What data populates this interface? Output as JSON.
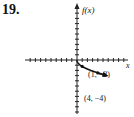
{
  "problem_number": "19.",
  "chart_data": {
    "type": "line",
    "title": "",
    "xlabel": "x",
    "ylabel": "f(x)",
    "function": "f(x) = -2√x",
    "x": [
      0,
      0.25,
      1,
      2.25,
      4,
      5.5
    ],
    "y": [
      0,
      -1,
      -2,
      -3,
      -4,
      -4.69
    ],
    "points_labeled": [
      {
        "label": "(1, −2)",
        "x": 1,
        "y": -2
      },
      {
        "label": "(4, −4)",
        "x": 4,
        "y": -4
      }
    ],
    "xlim": [
      -10,
      10
    ],
    "ylim": [
      -10,
      10
    ],
    "grid": false,
    "arrow_end": true
  },
  "labels": {
    "yaxis": "f(x)",
    "xaxis": "x",
    "p1": "(1, −2)",
    "p2": "(4, −4)"
  }
}
